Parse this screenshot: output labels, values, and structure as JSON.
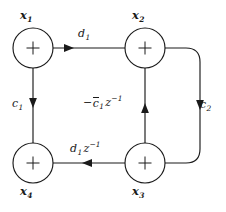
{
  "figure": {
    "kind": "signal-flow-graph",
    "background_color": "#ffffff",
    "line_color": "#1a1a1a"
  },
  "nodes": [
    {
      "id": "x1",
      "label": "x",
      "subscript": "1",
      "operator": "+",
      "position": "top-left",
      "cx": 33,
      "cy": 48,
      "r": 20
    },
    {
      "id": "x2",
      "label": "x",
      "subscript": "2",
      "operator": "+",
      "position": "top-right",
      "cx": 145,
      "cy": 48,
      "r": 20
    },
    {
      "id": "x3",
      "label": "x",
      "subscript": "3",
      "operator": "+",
      "position": "bottom-right",
      "cx": 145,
      "cy": 163,
      "r": 20
    },
    {
      "id": "x4",
      "label": "x",
      "subscript": "4",
      "operator": "+",
      "position": "bottom-left",
      "cx": 33,
      "cy": 163,
      "r": 20
    }
  ],
  "edges": [
    {
      "id": "e-x1-x2",
      "from": "x1",
      "to": "x2",
      "gain": "d",
      "gain_subscript": "1",
      "gain_text": "d_1",
      "direction": "right",
      "label_position": "above"
    },
    {
      "id": "e-x1-x4",
      "from": "x1",
      "to": "x4",
      "gain": "c",
      "gain_subscript": "1",
      "gain_text": "c_1",
      "direction": "down",
      "label_position": "left"
    },
    {
      "id": "e-x2-x3",
      "from": "x2",
      "to": "x3",
      "gain": "c",
      "gain_subscript": "2",
      "gain_text": "c_2",
      "direction": "down",
      "label_position": "right",
      "shape": "rounded-right-bypass"
    },
    {
      "id": "e-x3-x4",
      "from": "x3",
      "to": "x4",
      "gain": "d",
      "gain_subscript": "1",
      "gain_exponent": "-1",
      "gain_z": "z",
      "gain_text": "d_1 z^-1",
      "direction": "left",
      "label_position": "above"
    },
    {
      "id": "e-x3-x2",
      "from": "x3",
      "to": "x2",
      "gain_sign": "−",
      "gain": "c",
      "gain_overbar": true,
      "gain_subscript": "1",
      "gain_z": "z",
      "gain_exponent": "-1",
      "gain_text": "-cbar_1 z^-1",
      "direction": "up",
      "label_position": "left"
    }
  ],
  "labels": {
    "x1": {
      "base": "x",
      "sub": "1"
    },
    "x2": {
      "base": "x",
      "sub": "2"
    },
    "x3": {
      "base": "x",
      "sub": "3"
    },
    "x4": {
      "base": "x",
      "sub": "4"
    },
    "d1": {
      "base": "d",
      "sub": "1"
    },
    "c1": {
      "base": "c",
      "sub": "1"
    },
    "c2": {
      "base": "c",
      "sub": "2"
    },
    "d1z": {
      "base": "d",
      "sub": "1",
      "z": "z",
      "sup": "−1"
    },
    "cbar1z": {
      "sign": "−",
      "base": "c",
      "sub": "1",
      "z": "z",
      "sup": "−1"
    }
  },
  "operator_symbol": "+"
}
